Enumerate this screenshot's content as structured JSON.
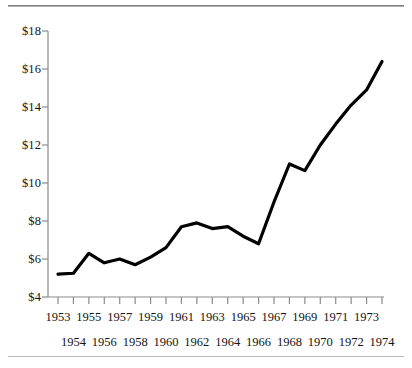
{
  "figure": {
    "background_color": "#ffffff",
    "line_color": "#000000",
    "axis_color": "#8a8a8a",
    "text_color": "#141414"
  },
  "chart_data": {
    "type": "line",
    "title": "",
    "subtitle": "",
    "xlabel": "",
    "ylabel": "",
    "grid": false,
    "legend": "none",
    "xlim": [
      1953,
      1974
    ],
    "ylim": [
      4,
      18
    ],
    "y_tick_labels": [
      "$4",
      "$6",
      "$8",
      "$10",
      "$12",
      "$14",
      "$16",
      "$18"
    ],
    "y_tick_values": [
      4,
      6,
      8,
      10,
      12,
      14,
      16,
      18
    ],
    "x_tick_labels_top_row": [
      "1953",
      "1955",
      "1957",
      "1959",
      "1961",
      "1963",
      "1965",
      "1967",
      "1969",
      "1971",
      "1973"
    ],
    "x_tick_labels_bottom_row": [
      "1954",
      "1956",
      "1958",
      "1960",
      "1962",
      "1964",
      "1966",
      "1968",
      "1970",
      "1972",
      "1974"
    ],
    "categories": [
      "1953",
      "1954",
      "1955",
      "1956",
      "1957",
      "1958",
      "1959",
      "1960",
      "1961",
      "1962",
      "1963",
      "1964",
      "1965",
      "1966",
      "1967",
      "1968",
      "1969",
      "1970",
      "1971",
      "1972",
      "1973",
      "1974"
    ],
    "values": [
      5.2,
      5.25,
      6.3,
      5.8,
      6.0,
      5.7,
      6.1,
      6.6,
      7.7,
      7.9,
      7.6,
      7.7,
      7.2,
      6.8,
      9.0,
      11.0,
      10.65,
      12.0,
      13.1,
      14.1,
      14.9,
      16.4
    ],
    "series": [
      {
        "name": "value",
        "values": [
          5.2,
          5.25,
          6.3,
          5.8,
          6.0,
          5.7,
          6.1,
          6.6,
          7.7,
          7.9,
          7.6,
          7.7,
          7.2,
          6.8,
          9.0,
          11.0,
          10.65,
          12.0,
          13.1,
          14.1,
          14.9,
          16.4
        ]
      }
    ]
  }
}
